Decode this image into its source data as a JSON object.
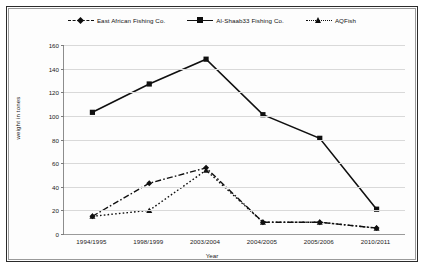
{
  "chart_data": {
    "type": "line",
    "title": "",
    "xlabel": "Year",
    "ylabel": "weight in tones",
    "ylim": [
      0,
      160
    ],
    "ytick_step": 20,
    "yticks": [
      0,
      20,
      40,
      60,
      80,
      100,
      120,
      140,
      160
    ],
    "grid": true,
    "legend_position": "top-center",
    "categories": [
      "1994/1995",
      "1998/1999",
      "2003/2004",
      "2004/2005",
      "2005/2006",
      "2010/2011"
    ],
    "series": [
      {
        "name": "East African Fishing Co.",
        "line_style": "dash-dot",
        "marker": "diamond",
        "color": "#101010",
        "values": [
          15,
          43,
          56,
          10,
          10,
          5
        ]
      },
      {
        "name": "Al-Shaab33 Fishing Co.",
        "line_style": "solid",
        "marker": "square",
        "color": "#101010",
        "values": [
          103,
          127,
          148,
          101,
          81,
          21
        ]
      },
      {
        "name": "AQFish",
        "line_style": "dotted",
        "marker": "triangle",
        "color": "#101010",
        "values": [
          15,
          20,
          54,
          10,
          10,
          5
        ]
      }
    ]
  },
  "legend": {
    "items": [
      {
        "label": "East African Fishing Co."
      },
      {
        "label": "Al-Shaab33 Fishing Co."
      },
      {
        "label": "AQFish"
      }
    ]
  },
  "axes": {
    "y_title": "weight in tones",
    "x_title": "Year"
  }
}
